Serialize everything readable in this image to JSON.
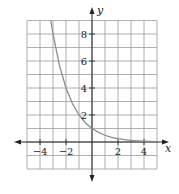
{
  "chart_data": {
    "type": "line",
    "title": "",
    "function": "y = (1/2)^x",
    "xlabel": "x",
    "ylabel": "y",
    "xlim": [
      -5,
      5
    ],
    "ylim": [
      -2,
      9
    ],
    "grid": true,
    "grid_step": 1,
    "x_ticks": [
      {
        "value": -4,
        "label": "−4"
      },
      {
        "value": -2,
        "label": "−2"
      },
      {
        "value": 2,
        "label": "2"
      },
      {
        "value": 4,
        "label": "4"
      }
    ],
    "y_ticks": [
      {
        "value": 2,
        "label": "2"
      },
      {
        "value": 4,
        "label": "4"
      },
      {
        "value": 6,
        "label": "6"
      },
      {
        "value": 8,
        "label": "8"
      }
    ],
    "series": [
      {
        "name": "exponential-decay",
        "x": [
          -3.17,
          -3,
          -2.5,
          -2,
          -1.5,
          -1,
          -0.5,
          0,
          0.5,
          1,
          1.5,
          2,
          2.5,
          3,
          3.5,
          4,
          4.5,
          5
        ],
        "y": [
          9,
          8,
          5.66,
          4,
          2.83,
          2,
          1.41,
          1,
          0.71,
          0.5,
          0.35,
          0.25,
          0.18,
          0.125,
          0.09,
          0.0625,
          0.044,
          0.031
        ],
        "color": "#8c8c8c"
      }
    ]
  }
}
